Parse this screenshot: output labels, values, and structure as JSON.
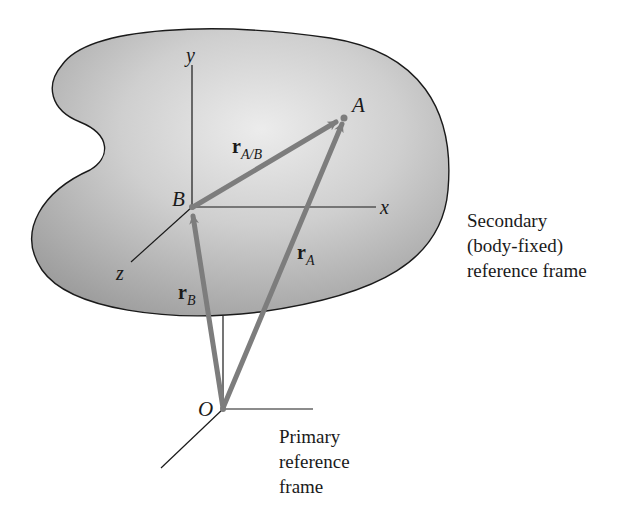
{
  "figure": {
    "body": {
      "fill": "#bdbdbd",
      "stroke": "#1a1a1a"
    },
    "vector_color": "#7d7d7d",
    "points": {
      "A": "A",
      "B": "B",
      "O": "O"
    },
    "axes": {
      "x": "x",
      "y": "y",
      "z": "z"
    },
    "vectors": {
      "r_AB": {
        "main": "r",
        "sub": "A/B"
      },
      "r_A": {
        "main": "r",
        "sub": "A"
      },
      "r_B": {
        "main": "r",
        "sub": "B"
      }
    },
    "captions": {
      "secondary": [
        "Secondary",
        "(body-fixed)",
        "reference frame"
      ],
      "primary": [
        "Primary",
        "reference",
        "frame"
      ]
    }
  }
}
